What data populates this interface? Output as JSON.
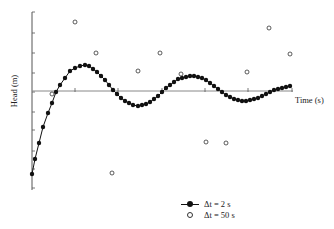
{
  "chart_data": {
    "type": "line",
    "title": "",
    "xlabel": "Time (s)",
    "ylabel": "Head (m)",
    "grid": false,
    "legend_position": "bottom-center",
    "axis_pixels": {
      "x0": 32,
      "x1": 293,
      "y_axis_top": 12,
      "y_axis_bottom": 190,
      "x_axis_y": 91
    },
    "x_ticks_px": [
      75,
      118,
      162,
      205,
      248,
      292
    ],
    "y_ticks_px": [
      12,
      33,
      53,
      73,
      92,
      112,
      130,
      151,
      169,
      188
    ],
    "series": [
      {
        "name": "Δt = 2 s",
        "style": "filled-circle-line",
        "color": "#111111",
        "points_px": [
          [
            32,
            174
          ],
          [
            35,
            159
          ],
          [
            39,
            143
          ],
          [
            43,
            127
          ],
          [
            48,
            113
          ],
          [
            52,
            103
          ],
          [
            56,
            92
          ],
          [
            60,
            85
          ],
          [
            65,
            78
          ],
          [
            70,
            71
          ],
          [
            75,
            68
          ],
          [
            80,
            66
          ],
          [
            85,
            65
          ],
          [
            89,
            66
          ],
          [
            93,
            69
          ],
          [
            97,
            72
          ],
          [
            101,
            76
          ],
          [
            105,
            80
          ],
          [
            109,
            85
          ],
          [
            113,
            90
          ],
          [
            117,
            94
          ],
          [
            121,
            98
          ],
          [
            125,
            101
          ],
          [
            129,
            103
          ],
          [
            133,
            105
          ],
          [
            138,
            106
          ],
          [
            142,
            105
          ],
          [
            146,
            104
          ],
          [
            150,
            102
          ],
          [
            154,
            99
          ],
          [
            158,
            96
          ],
          [
            162,
            92
          ],
          [
            166,
            88
          ],
          [
            170,
            85
          ],
          [
            174,
            82
          ],
          [
            178,
            79
          ],
          [
            182,
            78
          ],
          [
            186,
            77
          ],
          [
            190,
            76
          ],
          [
            194,
            76
          ],
          [
            198,
            77
          ],
          [
            202,
            78
          ],
          [
            206,
            80
          ],
          [
            210,
            83
          ],
          [
            214,
            86
          ],
          [
            218,
            89
          ],
          [
            222,
            92
          ],
          [
            226,
            95
          ],
          [
            230,
            97
          ],
          [
            234,
            99
          ],
          [
            238,
            100
          ],
          [
            242,
            101
          ],
          [
            246,
            101
          ],
          [
            250,
            100
          ],
          [
            254,
            99
          ],
          [
            258,
            98
          ],
          [
            262,
            96
          ],
          [
            266,
            94
          ],
          [
            270,
            92
          ],
          [
            274,
            90
          ],
          [
            278,
            89
          ],
          [
            282,
            88
          ],
          [
            286,
            87
          ],
          [
            290,
            86
          ]
        ]
      },
      {
        "name": "Δt = 50 s",
        "style": "open-circle",
        "color": "#333333",
        "points_px": [
          [
            52,
            94
          ],
          [
            75,
            22
          ],
          [
            96,
            53
          ],
          [
            112,
            173
          ],
          [
            138,
            71
          ],
          [
            160,
            53
          ],
          [
            181,
            74
          ],
          [
            206,
            142
          ],
          [
            226,
            143
          ],
          [
            247,
            72
          ],
          [
            269,
            28
          ],
          [
            290,
            54
          ]
        ]
      }
    ]
  },
  "legend": {
    "items": [
      {
        "label": "Δt = 2 s",
        "symbol": "filled-circle-line"
      },
      {
        "label": "Δt = 50 s",
        "symbol": "open-circle"
      }
    ]
  }
}
